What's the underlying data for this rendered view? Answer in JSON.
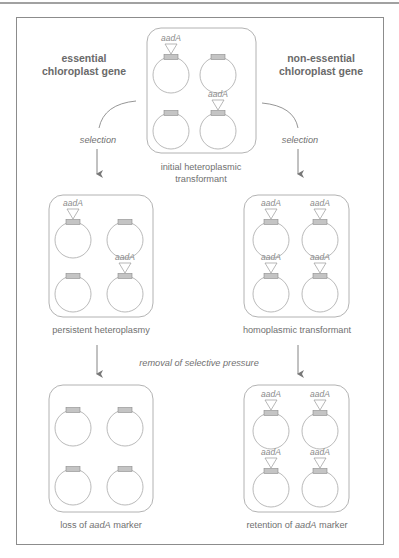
{
  "diagram": {
    "columns": {
      "left_title": [
        "essential",
        "chloroplast gene"
      ],
      "right_title": [
        "non-essential",
        "chloroplast gene"
      ]
    },
    "top_panel": {
      "caption": [
        "initial heteroplasmic",
        "transformant"
      ],
      "genomes": [
        {
          "position": "top-left",
          "aadA": true
        },
        {
          "position": "top-right",
          "aadA": false
        },
        {
          "position": "bottom-left",
          "aadA": false
        },
        {
          "position": "bottom-right",
          "aadA": true
        }
      ]
    },
    "arrows": {
      "left_selection": "selection",
      "right_selection": "selection",
      "removal": "removal of selective pressure"
    },
    "middle_left_panel": {
      "caption": "persistent heteroplasmy",
      "genomes": [
        {
          "position": "top-left",
          "aadA": true
        },
        {
          "position": "top-right",
          "aadA": false
        },
        {
          "position": "bottom-left",
          "aadA": false
        },
        {
          "position": "bottom-right",
          "aadA": true
        }
      ]
    },
    "middle_right_panel": {
      "caption": "homoplasmic transformant",
      "genomes": [
        {
          "position": "top-left",
          "aadA": true
        },
        {
          "position": "top-right",
          "aadA": true
        },
        {
          "position": "bottom-left",
          "aadA": true
        },
        {
          "position": "bottom-right",
          "aadA": true
        }
      ]
    },
    "bottom_left_panel": {
      "caption_prefix": "loss of ",
      "caption_gene": "aadA",
      "caption_suffix": " marker",
      "genomes": [
        {
          "position": "top-left",
          "aadA": false
        },
        {
          "position": "top-right",
          "aadA": false
        },
        {
          "position": "bottom-left",
          "aadA": false
        },
        {
          "position": "bottom-right",
          "aadA": false
        }
      ]
    },
    "bottom_right_panel": {
      "caption_prefix": "retention of ",
      "caption_gene": "aadA",
      "caption_suffix": " marker",
      "genomes": [
        {
          "position": "top-left",
          "aadA": true
        },
        {
          "position": "top-right",
          "aadA": true
        },
        {
          "position": "bottom-left",
          "aadA": true
        },
        {
          "position": "bottom-right",
          "aadA": true
        }
      ]
    },
    "gene_label": "aadA",
    "colors": {
      "line": "#9a9a9a",
      "frame": "#8c8c8c",
      "text": "#6e6e6e",
      "gene_box_fill": "#bdbdbd",
      "gene_box_stroke": "#888888"
    }
  }
}
